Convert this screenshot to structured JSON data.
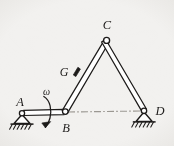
{
  "figure": {
    "background_color": "#f2f1ef",
    "ink_color": "#1d1b1a",
    "centerline_color": "#9b9892",
    "labels": {
      "a": "A",
      "b": "B",
      "c": "C",
      "d": "D",
      "g": "G",
      "omega": "ω"
    },
    "joints": [
      {
        "name": "A",
        "x": 22,
        "y": 114,
        "type": "pinned-support"
      },
      {
        "name": "B",
        "x": 65,
        "y": 112,
        "type": "pin-joint"
      },
      {
        "name": "C",
        "x": 107,
        "y": 41,
        "type": "pin-joint"
      },
      {
        "name": "D",
        "x": 144,
        "y": 111,
        "type": "pinned-support"
      },
      {
        "name": "G",
        "x": 76,
        "y": 72,
        "type": "marked-point"
      }
    ],
    "links": [
      {
        "name": "AB",
        "from": "A",
        "to": "B"
      },
      {
        "name": "BC",
        "from": "B",
        "to": "C"
      },
      {
        "name": "CD",
        "from": "C",
        "to": "D"
      }
    ],
    "centerline": {
      "name": "BD",
      "from": "B",
      "to": "D",
      "style": "dash-dot"
    },
    "omega_arrow": {
      "name": "angular-velocity",
      "at_link": "AB",
      "x": 48,
      "y": 112
    }
  }
}
